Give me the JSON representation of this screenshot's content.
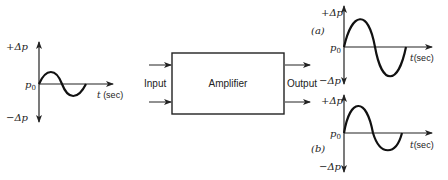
{
  "input_graph": {
    "plus_label": "+Δp",
    "minus_label": "−Δp",
    "origin_label": "p",
    "origin_sub": "0",
    "time_label_t": "t",
    "time_label_unit": " (sec)"
  },
  "amplifier": {
    "label": "Amplifier",
    "input_label": "Input",
    "output_label": "Output"
  },
  "output_graph_a": {
    "tag": "(a)",
    "plus_label": "+Δp",
    "minus_label": "−Δp",
    "origin_label": "p",
    "origin_sub": "0",
    "time_label_t": "t",
    "time_label_unit": "(sec)"
  },
  "output_graph_b": {
    "tag": "(b)",
    "plus_label": "+Δp",
    "minus_label": "−Δp",
    "origin_label": "p",
    "origin_sub": "0",
    "time_label_t": "t",
    "time_label_unit": "(sec)"
  },
  "colors": {
    "ink": "#222222",
    "background": "#ffffff"
  }
}
